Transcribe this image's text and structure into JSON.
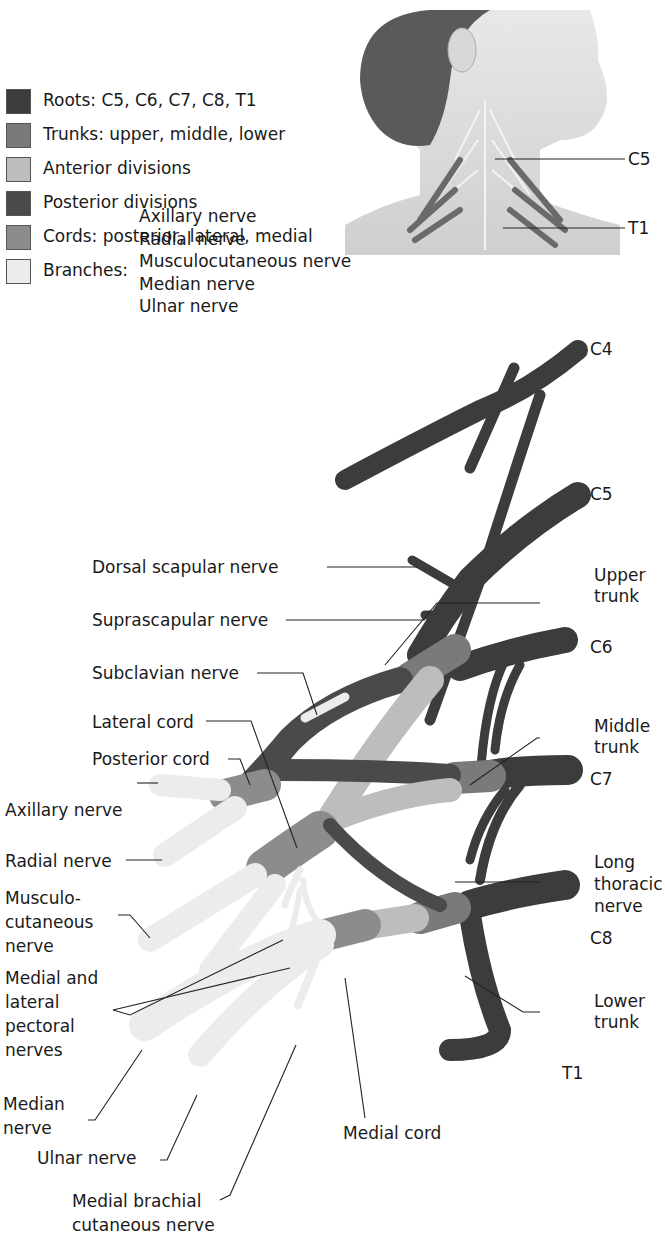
{
  "legend": {
    "items": [
      {
        "label": "Roots: C5, C6, C7, C8, T1",
        "color": "#3c3c3c"
      },
      {
        "label": "Trunks: upper, middle, lower",
        "color": "#7a7a7a"
      },
      {
        "label": "Anterior divisions",
        "color": "#bdbdbd"
      },
      {
        "label": "Posterior divisions",
        "color": "#4a4a4a"
      },
      {
        "label": "Cords: posterior, lateral, medial",
        "color": "#8c8c8c"
      },
      {
        "label": "Branches:",
        "color": "#ececec"
      }
    ],
    "branches": [
      "Axillary nerve",
      "Radial nerve",
      "Musculocutaneous nerve",
      "Median nerve",
      "Ulnar nerve"
    ]
  },
  "inset": {
    "labels": {
      "c5": "C5",
      "t1": "T1"
    }
  },
  "roots": {
    "c4": "C4",
    "c5": "C5",
    "c6": "C6",
    "c7": "C7",
    "c8": "C8",
    "t1": "T1"
  },
  "labels": {
    "dorsal_scapular": "Dorsal scapular nerve",
    "suprascapular": "Suprascapular nerve",
    "subclavian": "Subclavian nerve",
    "lateral_cord": "Lateral cord",
    "posterior_cord": "Posterior cord",
    "axillary": "Axillary nerve",
    "radial": "Radial nerve",
    "musculo": [
      "Musculo-",
      "cutaneous",
      "nerve"
    ],
    "pectoral": [
      "Medial and",
      "lateral",
      "pectoral",
      "nerves"
    ],
    "median": [
      "Median",
      "nerve"
    ],
    "ulnar": "Ulnar nerve",
    "medial_brachial": [
      "Medial brachial",
      "cutaneous nerve"
    ],
    "medial_cord": "Medial cord",
    "upper_trunk": [
      "Upper",
      "trunk"
    ],
    "middle_trunk": [
      "Middle",
      "trunk"
    ],
    "long_thoracic": [
      "Long",
      "thoracic",
      "nerve"
    ],
    "lower_trunk": [
      "Lower",
      "trunk"
    ]
  },
  "colors": {
    "root": "#3c3c3c",
    "trunk": "#7a7a7a",
    "anterior": "#bdbdbd",
    "posterior": "#4a4a4a",
    "cord": "#8c8c8c",
    "branch": "#ececec"
  }
}
